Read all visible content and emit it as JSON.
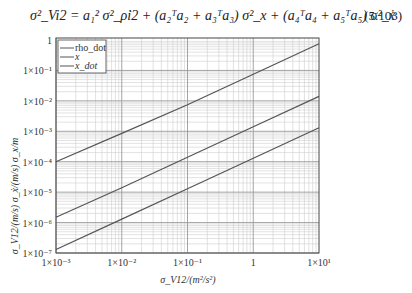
{
  "equation": {
    "text": "σ²_Vi2 = a₁² σ²_ρ̇i2 + (a₂ᵀa₂ + a₃ᵀa₃) σ²_x + (a₄ᵀa₄ + a₅ᵀa₅) σ²_ẋ",
    "number": "(5.103)"
  },
  "chart_data": {
    "type": "line",
    "title": "",
    "xlabel": "σ_V12/(m²/s²)",
    "ylabel": "σ_V12/(m/s)  σ_ẋ/(m/s)  σ_x/m",
    "xscale": "log",
    "yscale": "log",
    "xlim": [
      0.001,
      10
    ],
    "ylim": [
      1e-07,
      1
    ],
    "grid": true,
    "legend_position": "upper left",
    "x_tick_labels": [
      "1×10⁻³",
      "1×10⁻²",
      "1×10⁻¹",
      "1",
      "1×10¹"
    ],
    "y_tick_labels": [
      "1",
      "1×10⁻¹",
      "1×10⁻²",
      "1×10⁻³",
      "1×10⁻⁴",
      "1×10⁻⁵",
      "1×10⁻⁶",
      "1×10⁻⁷"
    ],
    "series": [
      {
        "name": "rho_dot",
        "x": [
          0.001,
          0.01,
          0.1,
          1,
          10
        ],
        "y": [
          0.0001,
          0.00085,
          0.0075,
          0.075,
          0.75
        ]
      },
      {
        "name": "x",
        "x": [
          0.001,
          0.01,
          0.1,
          1,
          10
        ],
        "y": [
          1.5e-06,
          1.4e-05,
          0.00014,
          0.0014,
          0.014
        ]
      },
      {
        "name": "x_dot",
        "x": [
          0.001,
          0.01,
          0.1,
          1,
          10
        ],
        "y": [
          1.3e-07,
          1.3e-06,
          1.3e-05,
          0.00013,
          0.0013
        ]
      }
    ]
  },
  "colors": {
    "line": "#555555",
    "grid_major": "#9a9a9a",
    "grid_minor": "#cfcfcf",
    "frame": "#444444"
  }
}
